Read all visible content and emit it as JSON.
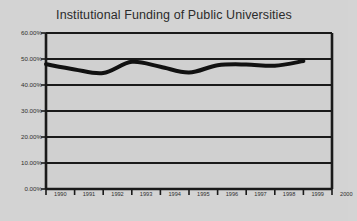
{
  "chart_data": {
    "type": "line",
    "title": "Institutional Funding of Public Universities",
    "xlabel": "",
    "ylabel": "",
    "grid": true,
    "legend": false,
    "x": [
      1990,
      1991,
      1992,
      1993,
      1994,
      1995,
      1996,
      1997,
      1998,
      1999,
      2000
    ],
    "xtick_labels": [
      "1990",
      "1991",
      "1992",
      "1993",
      "1994",
      "1995",
      "1996",
      "1997",
      "1998",
      "1999",
      "2000"
    ],
    "xlim": [
      1990,
      2000
    ],
    "ylim": [
      0,
      60
    ],
    "ytick_labels": [
      "60.00%",
      "50.00%",
      "40.00%",
      "30.00%",
      "20.00%",
      "10.00%",
      "0.00%"
    ],
    "ytick_values": [
      60,
      50,
      40,
      30,
      20,
      10,
      0
    ],
    "series": [
      {
        "name": "Institutional funding share",
        "values": [
          48.0,
          46.0,
          44.6,
          48.9,
          47.0,
          44.8,
          47.6,
          47.9,
          47.4,
          49.2,
          null
        ]
      }
    ],
    "line_color": "#111111",
    "line_width": 4,
    "plot_background": "#d0d0d0",
    "figure_background": "#d3d3d3",
    "axis_color": "#1a1a1a"
  }
}
